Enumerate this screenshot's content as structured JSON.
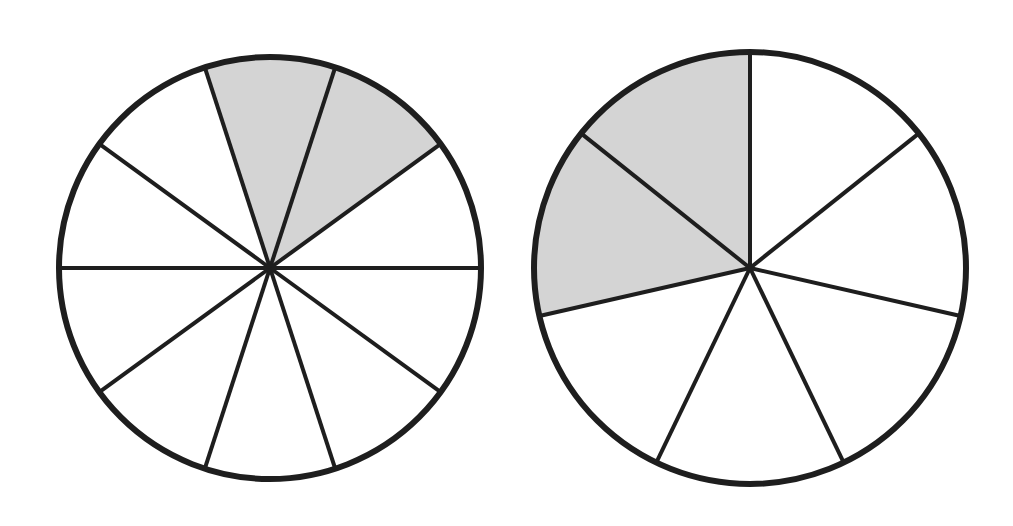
{
  "diagram": {
    "colors": {
      "stroke": "#1e1e1e",
      "shade": "#d4d4d4",
      "background": "#ffffff"
    },
    "circles": [
      {
        "name": "left-fraction-circle",
        "cx": 270,
        "cy": 268,
        "r": 211,
        "sectors": 10,
        "shaded": 2,
        "start_angle_deg": -108,
        "fraction_label": "2/10"
      },
      {
        "name": "right-fraction-circle",
        "cx": 750,
        "cy": 268,
        "r": 216,
        "sectors": 7,
        "shaded": 2,
        "start_angle_deg": -90,
        "fraction_label": "2/7",
        "shade_direction": "counterclockwise"
      }
    ]
  }
}
